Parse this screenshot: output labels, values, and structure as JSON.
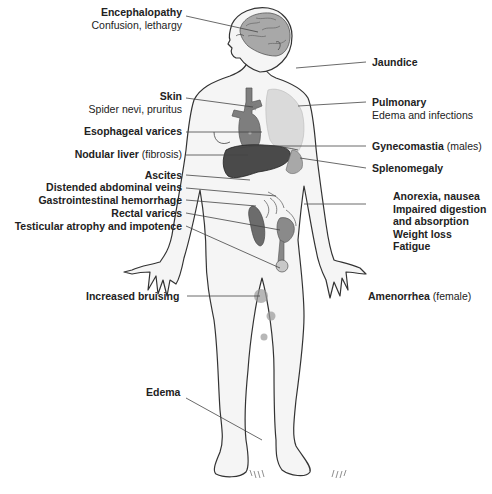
{
  "figure": {
    "colors": {
      "outline": "#333333",
      "skin": "#f4f4f4",
      "organ_dark": "#555555",
      "organ_mid": "#888888",
      "lung": "#d6d6d6",
      "heart": "#7a7a7a",
      "bruise": "#9a9a9a",
      "leader": "#444444"
    }
  },
  "labels": {
    "encephalopathy": {
      "title": "Encephalopathy",
      "detail": "Confusion, lethargy"
    },
    "skin": {
      "title": "Skin",
      "detail": "Spider nevi, pruritus"
    },
    "esophageal_varices": {
      "title": "Esophageal varices"
    },
    "nodular_liver": {
      "title": "Nodular liver",
      "detail": "(fibrosis)"
    },
    "ascites": {
      "title": "Ascites"
    },
    "distended_veins": {
      "title": "Distended abdominal veins"
    },
    "gi_hemorrhage": {
      "title": "Gastrointestinal hemorrhage"
    },
    "rectal_varices": {
      "title": "Rectal varices"
    },
    "testicular_atrophy": {
      "title": "Testicular atrophy and impotence"
    },
    "increased_bruising": {
      "title": "Increased bruising"
    },
    "edema": {
      "title": "Edema"
    },
    "jaundice": {
      "title": "Jaundice"
    },
    "pulmonary": {
      "title": "Pulmonary",
      "detail": "Edema and infections"
    },
    "gynecomastia": {
      "title": "Gynecomastia",
      "detail": "(males)"
    },
    "splenomegaly": {
      "title": "Splenomegaly"
    },
    "gi_symptoms": {
      "lines": [
        "Anorexia, nausea",
        "Impaired digestion",
        "and absorption",
        "Weight loss",
        "Fatigue"
      ]
    },
    "amenorrhea": {
      "title": "Amenorrhea",
      "detail": "(female)"
    }
  }
}
